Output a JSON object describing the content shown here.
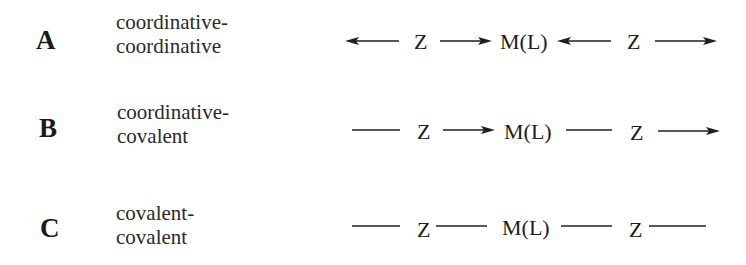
{
  "diagram": {
    "type": "bonding-schemes",
    "colors": {
      "ink": "#1e1e1e",
      "background": "#ffffff"
    },
    "rows": [
      {
        "label": "A",
        "description": [
          "coordinative-",
          "coordinative"
        ],
        "scheme": {
          "symbols": [
            "Z",
            "M(L)",
            "Z"
          ],
          "bonds": [
            "arrow-left",
            "arrow-right",
            "arrow-left",
            "arrow-right"
          ],
          "notation": "← Z → M(L) ← Z →"
        }
      },
      {
        "label": "B",
        "description": [
          "coordinative-",
          "covalent"
        ],
        "scheme": {
          "symbols": [
            "Z",
            "M(L)",
            "Z"
          ],
          "bonds": [
            "line",
            "arrow-right",
            "line",
            "arrow-right"
          ],
          "notation": "— Z → M(L) — Z →"
        }
      },
      {
        "label": "C",
        "description": [
          "covalent-",
          "covalent"
        ],
        "scheme": {
          "symbols": [
            "Z",
            "M(L)",
            "Z"
          ],
          "bonds": [
            "line",
            "line",
            "line",
            "line"
          ],
          "notation": "— Z— M(L)— Z—"
        }
      }
    ]
  }
}
